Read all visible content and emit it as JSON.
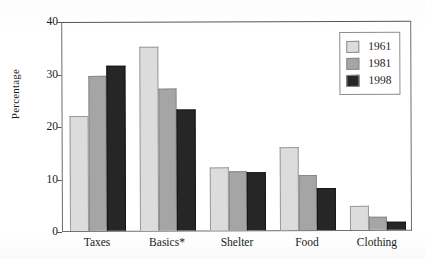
{
  "chart_data": {
    "type": "bar",
    "title": "",
    "subtitle": "",
    "xlabel": "",
    "ylabel": "Percentage",
    "categories": [
      "Taxes",
      "Basics*",
      "Shelter",
      "Food",
      "Clothing"
    ],
    "series": [
      {
        "name": "1961",
        "color": "#dcdcdc",
        "values": [
          22,
          35,
          12,
          15.8,
          4.5
        ]
      },
      {
        "name": "1981",
        "color": "#a5a5a5",
        "values": [
          29.5,
          27,
          11.2,
          10.5,
          2.5
        ]
      },
      {
        "name": "1998",
        "color": "#262626",
        "values": [
          31.5,
          23,
          11,
          8,
          1.5
        ]
      }
    ],
    "ylim": [
      0,
      40
    ],
    "yticks": [
      0,
      10,
      20,
      30,
      40
    ],
    "ytick_labels": [
      "0",
      "10",
      "20",
      "30",
      "40"
    ],
    "grid": false,
    "legend_position": "top-right",
    "legend_entries": [
      "1961",
      "1981",
      "1998"
    ],
    "annotations": [
      "Basics* denotes an asterisked footnote marker on the category label"
    ]
  }
}
